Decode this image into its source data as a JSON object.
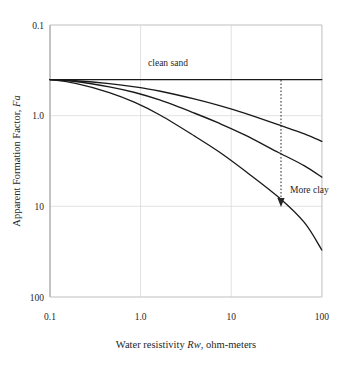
{
  "chart_data": {
    "type": "line",
    "title": "",
    "xlabel": "Water resistivity Rw, ohm-meters",
    "xlabel_plain": "Water resistivity ",
    "xlabel_italic": "Rw",
    "xlabel_tail": ", ohm-meters",
    "ylabel": "Apparent Formation Factor, Fa",
    "ylabel_plain": "Apparent Formation Factor, ",
    "ylabel_italic": "Fa",
    "xscale": "log",
    "yscale": "log",
    "xlim": [
      0.1,
      160
    ],
    "ylim": [
      0.1,
      100
    ],
    "grid": true,
    "legend": "none",
    "xticks": [
      "0.1",
      "1.0",
      "10",
      "100"
    ],
    "xtick_values": [
      0.1,
      1.0,
      10,
      100
    ],
    "yticks": [
      "0.1",
      "1.0",
      "10",
      "100"
    ],
    "ytick_values": [
      0.1,
      1.0,
      10,
      100
    ],
    "series": [
      {
        "name": "clean sand",
        "x": [
          0.1,
          0.2,
          0.5,
          1.0,
          2.0,
          5.0,
          10,
          20,
          50,
          100,
          160
        ],
        "values": [
          25,
          25,
          25,
          25,
          25,
          25,
          25,
          25,
          25,
          25,
          25
        ]
      },
      {
        "name": "slightly shaly sand",
        "x": [
          0.1,
          0.2,
          0.5,
          1.0,
          2.0,
          5.0,
          10,
          20,
          50,
          100,
          160
        ],
        "values": [
          25,
          24.3,
          22.6,
          20.8,
          18.6,
          15.3,
          12.9,
          10.6,
          7.9,
          6.3,
          5.2
        ]
      },
      {
        "name": "moderately shaly sand",
        "x": [
          0.1,
          0.2,
          0.5,
          1.0,
          2.0,
          5.0,
          10,
          20,
          50,
          100,
          160
        ],
        "values": [
          25,
          23.8,
          20.8,
          18.0,
          14.8,
          10.7,
          8.2,
          6.1,
          3.9,
          2.8,
          2.1
        ]
      },
      {
        "name": "very shaly sand",
        "x": [
          0.1,
          0.2,
          0.5,
          1.0,
          2.0,
          5.0,
          10,
          20,
          50,
          100,
          160
        ],
        "values": [
          25,
          22.7,
          18.0,
          14.0,
          10.1,
          6.0,
          3.95,
          2.45,
          1.25,
          0.66,
          0.33
        ]
      }
    ],
    "annotations": [
      {
        "text": "clean sand",
        "x_px": 168,
        "y_px": 66
      },
      {
        "text": "More clay",
        "x_px": 290,
        "y_px": 193
      }
    ],
    "arrow": {
      "name": "more-clay-arrow",
      "style": "dotted-vertical-down",
      "x_px": 281,
      "y_top_px": 80,
      "y_bottom_px": 207
    },
    "colors": {
      "curve": "#1a1a1a",
      "grid": "#d9d9d9",
      "frame": "#b3b3b3",
      "text": "#262626",
      "background": "#ffffff"
    }
  }
}
